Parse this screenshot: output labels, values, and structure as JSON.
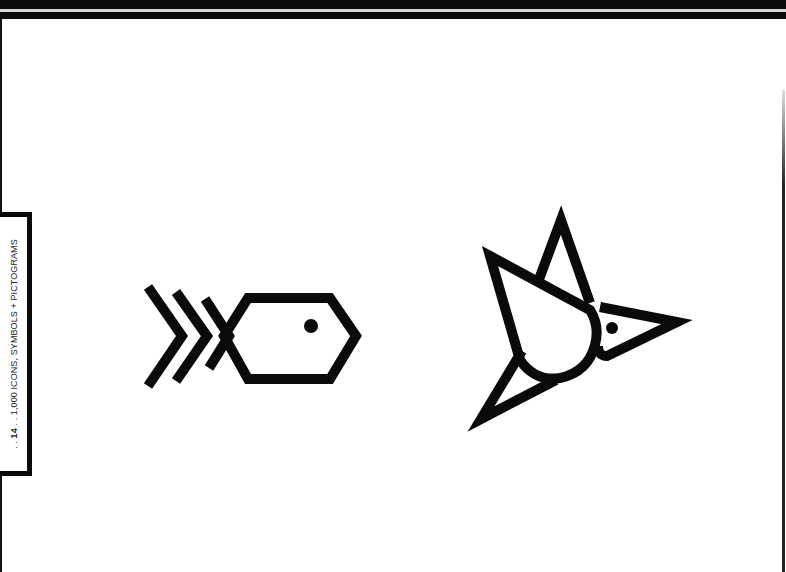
{
  "page": {
    "side_tab": {
      "prefix": ". . ",
      "page_number": "14",
      "separator": " . . ",
      "book_title": "1,000 ICONS, SYMBOLS + PICTOGRAMS"
    },
    "icons": [
      {
        "name": "fish-icon",
        "description": "Geometric fish with hexagonal body and three chevron fins"
      },
      {
        "name": "bird-icon",
        "description": "Geometric bird in flight with triangular wings and pointed beak"
      }
    ],
    "colors": {
      "ink": "#0a0a0a",
      "paper": "#ffffff"
    }
  }
}
